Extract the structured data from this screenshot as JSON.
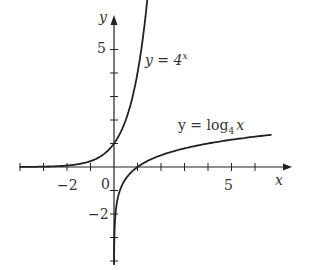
{
  "chart_data": {
    "type": "line",
    "title": "",
    "xlabel": "x",
    "ylabel": "y",
    "xlim": [
      -4,
      7.3
    ],
    "ylim": [
      -5.2,
      6.3
    ],
    "grid": false,
    "x_tick_labels": [
      "-2",
      "0",
      "5"
    ],
    "y_tick_labels": [
      "5",
      "-2"
    ],
    "x_ticks": [
      -4,
      -3,
      -2,
      -1,
      1,
      2,
      3,
      4,
      5,
      6
    ],
    "y_ticks": [
      -4,
      -3,
      -2,
      -1,
      1,
      2,
      3,
      4,
      5
    ],
    "series": [
      {
        "name": "y = 4^x",
        "function": "4^x",
        "label_text": "y = 4",
        "label_exp": "x"
      },
      {
        "name": "y = log4 x",
        "function": "log4(x)",
        "label_text": "y = log",
        "label_sub": "4",
        "label_var": "x"
      }
    ]
  },
  "labels": {
    "x_axis": "x",
    "y_axis": "y",
    "tick_minus2_x": "−2",
    "tick_0": "0",
    "tick_5_x": "5",
    "tick_5_y": "5",
    "tick_minus2_y": "−2",
    "exp_label_main": "y = 4",
    "exp_label_sup": "x",
    "log_label_main": "y = log",
    "log_label_sub": "4",
    "log_label_var": "x"
  }
}
